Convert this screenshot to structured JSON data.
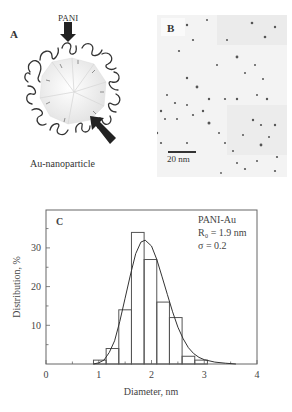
{
  "panels": {
    "a": {
      "label": "A",
      "pani_label": "PANI",
      "caption": "Au-nanoparticle"
    },
    "b": {
      "label": "B",
      "scale_bar_label": "20 nm"
    },
    "c": {
      "label": "C",
      "legend": {
        "line1": "PANI-Au",
        "line2": "R₀ = 1.9 nm",
        "line3": "σ = 0.2"
      },
      "xlabel": "Diameter, nm",
      "ylabel": "Distribution, %",
      "xticks": [
        "0",
        "1",
        "2",
        "3",
        "4"
      ],
      "yticks": [
        "10",
        "20",
        "30"
      ]
    }
  },
  "colors": {
    "axis": "#555555",
    "bar_stroke": "#555555",
    "curve": "#333333",
    "text": "#444444"
  },
  "chart_data": {
    "type": "bar",
    "title": "",
    "panel": "C",
    "xlabel": "Diameter, nm",
    "ylabel": "Distribution, %",
    "xlim": [
      0,
      4
    ],
    "ylim": [
      0,
      37
    ],
    "xticks": [
      0,
      1,
      2,
      3,
      4
    ],
    "yticks": [
      10,
      20,
      30
    ],
    "grid": false,
    "legend_position": "top-right",
    "annotations": [
      "PANI-Au",
      "R0 = 1.9 nm",
      "σ = 0.2"
    ],
    "bin_width": 0.24,
    "categories": [
      "0.90-1.14",
      "1.14-1.38",
      "1.38-1.62",
      "1.62-1.86",
      "1.86-2.10",
      "2.10-2.34",
      "2.34-2.58",
      "2.58-2.82",
      "2.82-3.06"
    ],
    "bin_left": [
      0.9,
      1.14,
      1.38,
      1.62,
      1.86,
      2.1,
      2.34,
      2.58,
      2.82
    ],
    "values": [
      1,
      4,
      14,
      34,
      27,
      16,
      12,
      2,
      1
    ],
    "fit_curve": {
      "type": "log-normal",
      "peak_x": 1.88,
      "peak_y": 32,
      "x": [
        0.9,
        1.0,
        1.1,
        1.2,
        1.3,
        1.4,
        1.5,
        1.6,
        1.7,
        1.8,
        1.88,
        2.0,
        2.1,
        2.2,
        2.3,
        2.4,
        2.5,
        2.6,
        2.7,
        2.8,
        2.9,
        3.0,
        3.2,
        3.4,
        3.6
      ],
      "y": [
        0,
        0.3,
        1,
        3,
        6,
        11,
        17,
        23,
        28.5,
        31.5,
        32,
        30.5,
        27,
        22.5,
        18,
        13.5,
        9.5,
        6.5,
        4.2,
        2.7,
        1.7,
        1.1,
        0.5,
        0.2,
        0
      ]
    }
  }
}
